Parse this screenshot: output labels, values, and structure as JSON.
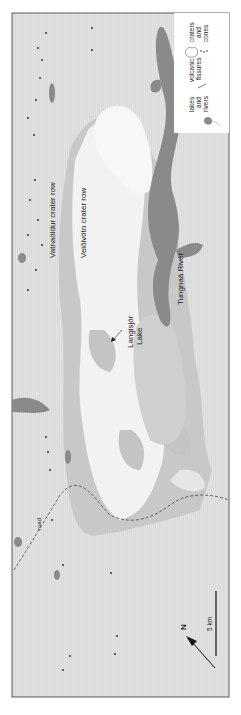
{
  "figure": {
    "orientation": "rotated 90 degrees counter-clockwise",
    "colors": {
      "background": "#dcdcdc",
      "lava_light": "#f3f3f3",
      "lava_mid": "#c9c9c9",
      "water": "#8a8a8a",
      "frame": "#555555",
      "legend_bg": "#ffffff"
    }
  },
  "labels": {
    "vatnaoldur": "Vatnaöldur crater row",
    "veidivotn": "Veiðivötn crater row",
    "langisjor_1": "Langisjór",
    "langisjor_2": "Lake",
    "tungnaa": "Tungnaá River",
    "road": "road"
  },
  "legend": {
    "items": [
      {
        "icon": "lake-river-icon",
        "line1": "lakes",
        "line2": "and",
        "line3": "rivers"
      },
      {
        "icon": "fissure-icon",
        "line1": "volcanic",
        "line2": "fissures",
        "line3": ""
      },
      {
        "icon": "crater-cone-icon",
        "line1": "craters",
        "line2": "and",
        "line3": "cones"
      }
    ]
  },
  "scale_bar": {
    "label": "5 km"
  },
  "north_arrow": {
    "label": "N"
  }
}
